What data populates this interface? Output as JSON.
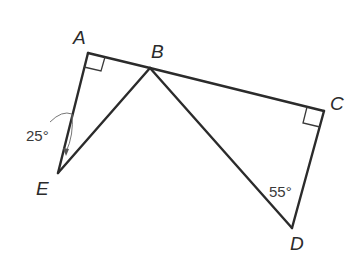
{
  "diagram": {
    "type": "geometry",
    "vertices": {
      "A": {
        "label": "A",
        "x": 88,
        "y": 53
      },
      "B": {
        "label": "B",
        "x": 150,
        "y": 68
      },
      "C": {
        "label": "C",
        "x": 324,
        "y": 111
      },
      "D": {
        "label": "D",
        "x": 292,
        "y": 228
      },
      "E": {
        "label": "E",
        "x": 58,
        "y": 173
      }
    },
    "segments": [
      "AB",
      "BC",
      "AE",
      "BE",
      "BD",
      "CD"
    ],
    "right_angles": [
      "A",
      "C"
    ],
    "angles": [
      {
        "at": "AEB (at A-E arc)",
        "label": "25°"
      },
      {
        "at": "D",
        "label": "55°"
      }
    ],
    "labels": {
      "A": "A",
      "B": "B",
      "C": "C",
      "D": "D",
      "E": "E",
      "angle_25": "25°",
      "angle_55": "55°"
    }
  }
}
